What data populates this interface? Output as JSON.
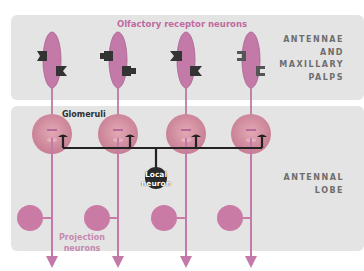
{
  "diagram": {
    "title": "Olfactory receptor neurons",
    "regions": [
      {
        "id": "top",
        "label_lines": [
          "ANTENNAE",
          "AND",
          "MAXILLARY",
          "PALPS"
        ]
      },
      {
        "id": "bottom",
        "label_lines": [
          "ANTENNAL",
          "LOBE"
        ]
      }
    ],
    "labels": {
      "glomeruli": "Glomeruli",
      "local_neuron_line1": "Local",
      "local_neuron_line2": "neuron",
      "projection_line1": "Projection",
      "projection_line2": "neurons"
    },
    "neuron_columns": [
      {
        "x": 52,
        "receptor_shape": "notched-left / flag-right"
      },
      {
        "x": 118,
        "receptor_shape": "block / knob"
      },
      {
        "x": 186,
        "receptor_shape": "notched / flag"
      },
      {
        "x": 251,
        "receptor_shape": "bracket / bracket"
      }
    ],
    "colors": {
      "band": "#e4e4e4",
      "neuron": "#c47aa8",
      "glomerulus": "#d591a2",
      "projection_soma": "#c97ba6",
      "receptor": "#3a3a3a",
      "local_neuron": "#2a2a2a",
      "title": "#c06aa0",
      "region_label": "#6e6e6e"
    }
  }
}
